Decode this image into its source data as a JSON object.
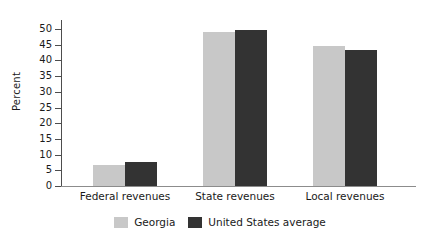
{
  "chart_data": {
    "type": "bar",
    "title": "",
    "xlabel": "",
    "ylabel": "Percent",
    "ylim": [
      0,
      50
    ],
    "yticks": [
      0,
      5,
      10,
      15,
      20,
      25,
      30,
      35,
      40,
      45,
      50
    ],
    "ytick_labels": [
      "0",
      "5",
      "10",
      "15",
      "20",
      "25",
      "30",
      "35",
      "40",
      "45",
      "50"
    ],
    "grid": false,
    "legend_position": "bottom-center",
    "categories": [
      "Federal revenues",
      "State revenues",
      "Local revenues"
    ],
    "series": [
      {
        "name": "Georgia",
        "color": "#c8c8c8",
        "values": [
          6.8,
          49.0,
          44.5
        ]
      },
      {
        "name": "United States average",
        "color": "#333333",
        "values": [
          7.8,
          49.8,
          43.2
        ]
      }
    ]
  },
  "legend": {
    "items": [
      {
        "label": "Georgia",
        "color": "#c8c8c8"
      },
      {
        "label": "United States average",
        "color": "#333333"
      }
    ]
  },
  "colors": {
    "georgia": "#c8c8c8",
    "united_states_average": "#333333",
    "axis": "#4d4d4d",
    "baseline": "#8c8c8c",
    "text": "#1a1a1a",
    "background": "#ffffff"
  }
}
